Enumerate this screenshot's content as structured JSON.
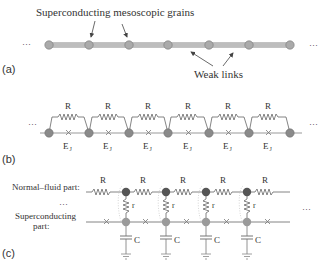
{
  "panel_a": {
    "label": "(a)",
    "title": "Superconducting mesoscopic grains",
    "weak_links": "Weak links",
    "ellipsis_left": "···",
    "ellipsis_right": "···",
    "bar_color": "#bdbdbd",
    "node_color": "#a8a8a8",
    "nodes_x": [
      49,
      89,
      129,
      168,
      209,
      249,
      290
    ]
  },
  "panel_b": {
    "label": "(b)",
    "resistor_label": "R",
    "junction_label": "E",
    "junction_sub": "J",
    "ellipsis_left": "···",
    "ellipsis_right": "···",
    "node_color": "#8a8a8a",
    "nodes_x": [
      49,
      89,
      129,
      168,
      209,
      249,
      290
    ]
  },
  "panel_c": {
    "label": "(c)",
    "normal_label": "Normal–fluid part:",
    "super_label_1": "Superconducting",
    "super_label_2": "part:",
    "ellipsis_mid": "···",
    "ellipsis_right": "···",
    "resistor_label": "R",
    "shunt_label": "r",
    "cap_label": "C",
    "normal_node_color": "#555555",
    "super_node_color": "#9a9a9a",
    "nodes_x": [
      126,
      166,
      206,
      247
    ]
  }
}
